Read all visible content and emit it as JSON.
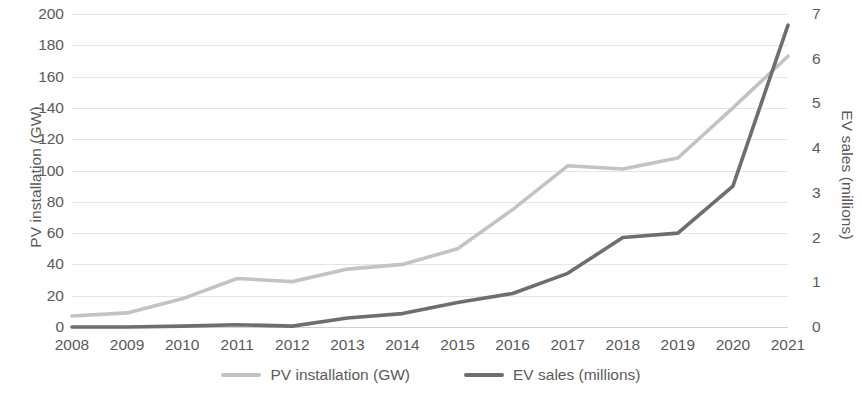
{
  "chart_data": {
    "type": "line",
    "title": "",
    "subtitle": "",
    "xlabel": "",
    "ylabel": "PV installation (GW)",
    "y2label": "EV sales (millions)",
    "categories": [
      "2008",
      "2009",
      "2010",
      "2011",
      "2012",
      "2013",
      "2014",
      "2015",
      "2016",
      "2017",
      "2018",
      "2019",
      "2020",
      "2021"
    ],
    "ylim": [
      0,
      200
    ],
    "y2lim": [
      0,
      7
    ],
    "yticks": [
      0,
      20,
      40,
      60,
      80,
      100,
      120,
      140,
      160,
      180,
      200
    ],
    "y2ticks": [
      0,
      1,
      2,
      3,
      4,
      5,
      6,
      7
    ],
    "ytick_labels": [
      "0",
      "20",
      "40",
      "60",
      "80",
      "100",
      "120",
      "140",
      "160",
      "180",
      "200"
    ],
    "y2tick_labels": [
      "0",
      "1",
      "2",
      "3",
      "4",
      "5",
      "6",
      "7"
    ],
    "grid": true,
    "grid_axis": "y",
    "legend_position": "bottom",
    "series": [
      {
        "name": "PV installation (GW)",
        "axis": "left",
        "color": "#c3c3c3",
        "values": [
          7,
          9,
          18,
          31,
          29,
          37,
          40,
          50,
          75,
          103,
          101,
          108,
          140,
          173
        ]
      },
      {
        "name": "EV sales (millions)",
        "axis": "right",
        "color": "#6e6e6e",
        "values": [
          0.0,
          0.0,
          0.02,
          0.05,
          0.02,
          0.2,
          0.3,
          0.55,
          0.75,
          1.2,
          2.0,
          2.1,
          3.15,
          6.75
        ]
      }
    ]
  },
  "legend": {
    "entries": [
      {
        "label": "PV installation (GW)",
        "color": "#c3c3c3"
      },
      {
        "label": "EV sales (millions)",
        "color": "#6e6e6e"
      }
    ]
  },
  "colors": {
    "background": "#ffffff",
    "text": "#5a5a5a",
    "gridline": "#e4e4e4",
    "pv_line": "#c3c3c3",
    "ev_line": "#6e6e6e"
  }
}
